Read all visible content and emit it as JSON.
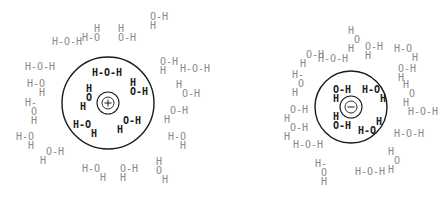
{
  "diagram": {
    "colors": {
      "inner_molecule": "#1a1a1a",
      "outer_molecule": "#8a8a8a",
      "shell": "#1a1a1a",
      "background": "#ffffff"
    },
    "cation": {
      "sign": "+",
      "center": [
        108,
        103
      ],
      "shell_radius": 46,
      "ion_outer_radius": 11,
      "ion_inner_radius": 6,
      "inner_molecules": [
        {
          "x": 92,
          "y": 76,
          "lines": [
            "H-O-H"
          ]
        },
        {
          "x": 80,
          "y": 92,
          "lines": [
            " H",
            " O",
            "H"
          ]
        },
        {
          "x": 130,
          "y": 86,
          "lines": [
            "H",
            "O-H"
          ]
        },
        {
          "x": 73,
          "y": 128,
          "lines": [
            "H-O",
            "   H"
          ]
        },
        {
          "x": 117,
          "y": 124,
          "lines": [
            " O-H",
            "H"
          ]
        }
      ],
      "outer_molecules": [
        {
          "x": 52,
          "y": 45,
          "lines": [
            "H-O-H"
          ]
        },
        {
          "x": 82,
          "y": 32,
          "lines": [
            "  H",
            "H-O"
          ]
        },
        {
          "x": 118,
          "y": 32,
          "lines": [
            "H",
            "O-H"
          ]
        },
        {
          "x": 150,
          "y": 20,
          "lines": [
            "O-H",
            "H"
          ]
        },
        {
          "x": 25,
          "y": 70,
          "lines": [
            "H-O-H"
          ]
        },
        {
          "x": 27,
          "y": 87,
          "lines": [
            "H-O",
            "  H"
          ]
        },
        {
          "x": 25,
          "y": 106,
          "lines": [
            "H-",
            " O",
            " H"
          ]
        },
        {
          "x": 16,
          "y": 140,
          "lines": [
            "H-O",
            "  H"
          ]
        },
        {
          "x": 40,
          "y": 155,
          "lines": [
            " O-H",
            "H"
          ]
        },
        {
          "x": 82,
          "y": 172,
          "lines": [
            "H-O",
            "   H"
          ]
        },
        {
          "x": 120,
          "y": 172,
          "lines": [
            "O-H",
            "H"
          ]
        },
        {
          "x": 156,
          "y": 165,
          "lines": [
            "H",
            "O",
            " H"
          ]
        },
        {
          "x": 160,
          "y": 65,
          "lines": [
            "O-H",
            "H"
          ]
        },
        {
          "x": 180,
          "y": 72,
          "lines": [
            "H-O-H"
          ]
        },
        {
          "x": 176,
          "y": 88,
          "lines": [
            "H",
            " O-H"
          ]
        },
        {
          "x": 164,
          "y": 114,
          "lines": [
            " O-H",
            "H"
          ]
        },
        {
          "x": 168,
          "y": 140,
          "lines": [
            "H-O",
            "  H"
          ]
        }
      ]
    },
    "anion": {
      "sign": "−",
      "center": [
        351,
        107
      ],
      "shell_radius": 36,
      "ion_outer_radius": 11,
      "ion_inner_radius": 6,
      "inner_molecules": [
        {
          "x": 333,
          "y": 93,
          "lines": [
            "O-H",
            "H"
          ]
        },
        {
          "x": 362,
          "y": 93,
          "lines": [
            "H-O",
            "   H"
          ]
        },
        {
          "x": 333,
          "y": 120,
          "lines": [
            "H",
            "O-H"
          ]
        },
        {
          "x": 358,
          "y": 125,
          "lines": [
            "   H",
            "H-O"
          ]
        }
      ],
      "outer_molecuLes": [],
      "outer_molecules": [
        {
          "x": 300,
          "y": 58,
          "lines": [
            " O-H",
            "H"
          ]
        },
        {
          "x": 318,
          "y": 62,
          "lines": [
            "H-O-H"
          ]
        },
        {
          "x": 348,
          "y": 34,
          "lines": [
            "H",
            " O",
            "H"
          ]
        },
        {
          "x": 365,
          "y": 50,
          "lines": [
            "O-H",
            "H"
          ]
        },
        {
          "x": 292,
          "y": 78,
          "lines": [
            "H-",
            " O",
            "H"
          ]
        },
        {
          "x": 394,
          "y": 52,
          "lines": [
            "H-O",
            "   H"
          ]
        },
        {
          "x": 398,
          "y": 72,
          "lines": [
            "O-H",
            "H"
          ]
        },
        {
          "x": 403,
          "y": 88,
          "lines": [
            "H",
            " O",
            "H"
          ]
        },
        {
          "x": 408,
          "y": 115,
          "lines": [
            "H-O-H"
          ]
        },
        {
          "x": 394,
          "y": 137,
          "lines": [
            "H-O-H"
          ]
        },
        {
          "x": 284,
          "y": 113,
          "lines": [
            " O-H",
            "H"
          ]
        },
        {
          "x": 284,
          "y": 131,
          "lines": [
            " O-H",
            "H"
          ]
        },
        {
          "x": 293,
          "y": 148,
          "lines": [
            "H-O-H"
          ]
        },
        {
          "x": 315,
          "y": 167,
          "lines": [
            "H-",
            " O",
            " H"
          ]
        },
        {
          "x": 355,
          "y": 175,
          "lines": [
            "H-O-H"
          ]
        },
        {
          "x": 388,
          "y": 155,
          "lines": [
            "H",
            " O",
            "H"
          ]
        }
      ]
    }
  }
}
